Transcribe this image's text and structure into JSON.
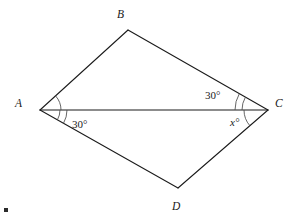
{
  "figure": {
    "background_color": "#ffffff",
    "line_color": "#1a1a1a",
    "arc_color": "#4a4a4a",
    "vertices": [
      {
        "name": "A",
        "label": "A",
        "x": 40,
        "y": 110,
        "label_x": 15,
        "label_y": 107
      },
      {
        "name": "B",
        "label": "B",
        "x": 128,
        "y": 30,
        "label_x": 117,
        "label_y": 18
      },
      {
        "name": "C",
        "label": "C",
        "x": 268,
        "y": 110,
        "label_x": 275,
        "label_y": 107
      },
      {
        "name": "D",
        "label": "D",
        "x": 178,
        "y": 188,
        "label_x": 172,
        "label_y": 210
      }
    ],
    "segments": [
      {
        "name": "side-AB",
        "from": "A",
        "to": "B"
      },
      {
        "name": "side-BC",
        "from": "B",
        "to": "C"
      },
      {
        "name": "side-CD",
        "from": "C",
        "to": "D"
      },
      {
        "name": "side-DA",
        "from": "D",
        "to": "A"
      },
      {
        "name": "diagonal-AC",
        "from": "A",
        "to": "C"
      }
    ],
    "angles": [
      {
        "name": "angle-BAC",
        "vertex": "A",
        "label": "",
        "arc_count": 1,
        "position": "above-diagonal"
      },
      {
        "name": "angle-CAD",
        "vertex": "A",
        "label": "30°",
        "label_x": 72,
        "label_y": 128,
        "arc_count": 2,
        "position": "below-diagonal"
      },
      {
        "name": "angle-BCA",
        "vertex": "C",
        "label": "30°",
        "label_x": 205,
        "label_y": 99,
        "arc_count": 2,
        "position": "above-diagonal"
      },
      {
        "name": "angle-ACD",
        "vertex": "C",
        "label": "x°",
        "label_x": 230,
        "label_y": 126,
        "arc_count": 1,
        "position": "below-diagonal"
      }
    ],
    "corner_mark": {
      "name": "page-corner-mark",
      "x": 4,
      "y": 208,
      "w": 4,
      "h": 4
    }
  }
}
